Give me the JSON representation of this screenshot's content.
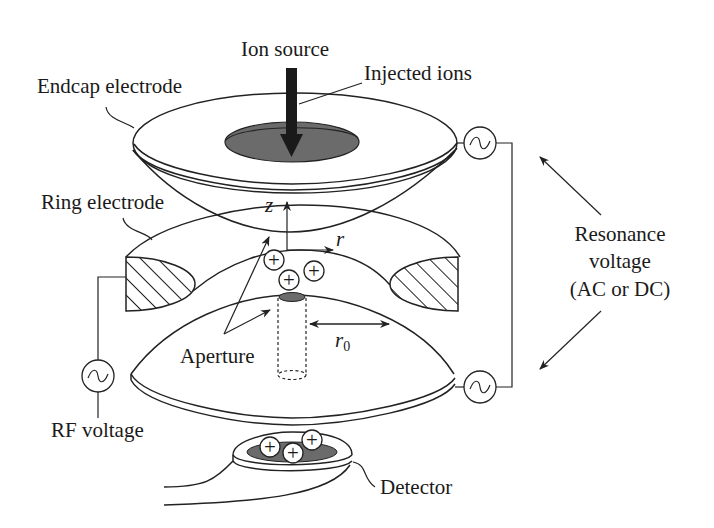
{
  "colors": {
    "line": "#222222",
    "fill_gray": "#6b6b6b",
    "arrow_dark": "#1a1a1a",
    "background": "#ffffff"
  },
  "labels": {
    "ion_source": "Ion source",
    "injected_ions": "Injected ions",
    "endcap_electrode": "Endcap electrode",
    "ring_electrode": "Ring electrode",
    "z_axis": "z",
    "r_axis": "r",
    "r0": "r",
    "r0_sub": "0",
    "aperture": "Aperture",
    "rf_voltage": "RF voltage",
    "resonance_line1": "Resonance",
    "resonance_line2": "voltage",
    "resonance_line3": "(AC or DC)",
    "detector": "Detector"
  },
  "ion_symbol": "+",
  "ions": {
    "trap": [
      {
        "cx": 274,
        "cy": 260
      },
      {
        "cx": 289,
        "cy": 280
      },
      {
        "cx": 314,
        "cy": 271
      }
    ],
    "detector": [
      {
        "cx": 270,
        "cy": 447
      },
      {
        "cx": 293,
        "cy": 453
      },
      {
        "cx": 312,
        "cy": 440
      }
    ]
  },
  "ac_sources": [
    {
      "name": "endcap-top-source",
      "cx": 480,
      "cy": 143
    },
    {
      "name": "endcap-bottom-source",
      "cx": 480,
      "cy": 387
    },
    {
      "name": "rf-source",
      "cx": 98,
      "cy": 376
    }
  ]
}
